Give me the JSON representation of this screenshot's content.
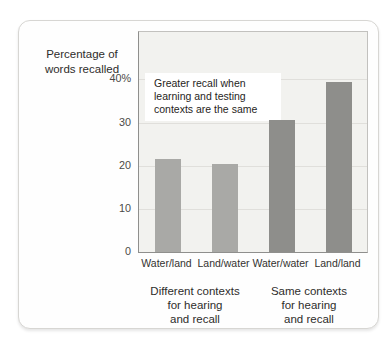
{
  "chart_data": {
    "type": "bar",
    "title": "",
    "ylabel": "Percentage of words recalled",
    "ylabel_display": "Percentage of\nwords recalled",
    "xlabel": "",
    "categories": [
      "Water/land",
      "Land/water",
      "Water/water",
      "Land/land"
    ],
    "values": [
      21.5,
      20.5,
      30.5,
      39.5
    ],
    "bar_colors": [
      "#a9a9a6",
      "#a9a9a6",
      "#8e8e8b",
      "#8e8e8b"
    ],
    "ylim": [
      0,
      51
    ],
    "yticks": [
      {
        "value": 0,
        "label": "0"
      },
      {
        "value": 10,
        "label": "10"
      },
      {
        "value": 20,
        "label": "20"
      },
      {
        "value": 30,
        "label": "30"
      },
      {
        "value": 40,
        "label": "40%"
      }
    ],
    "grid": true,
    "legend": null,
    "annotation": "Greater recall when\nlearning and testing\ncontexts are the same",
    "group_labels": [
      "Different contexts\nfor hearing\nand recall",
      "Same contexts\nfor hearing\nand recall"
    ]
  },
  "colors": {
    "plot_background": "#f2f2ef",
    "gridline": "#e0dfdb",
    "axis": "#8f8f8d",
    "frame": "#c2c1be",
    "bar_light": "#a9a9a6",
    "bar_dark": "#8e8e8b",
    "card_border": "#d7d6d3",
    "text": "#2e2d2b"
  }
}
